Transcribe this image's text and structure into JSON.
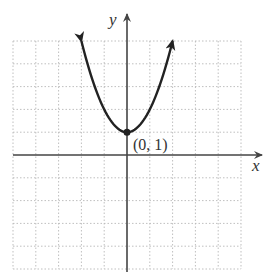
{
  "chart_data": {
    "type": "line",
    "title": "",
    "function": "y = x^2 + 1",
    "xlabel": "x",
    "ylabel": "y",
    "xlim": [
      -5,
      5
    ],
    "ylim": [
      -5,
      5
    ],
    "grid": true,
    "grid_style": "dotted",
    "tick_labels_shown": false,
    "series": [
      {
        "name": "parabola",
        "x": [
          -2,
          -1.5,
          -1,
          -0.5,
          0,
          0.5,
          1,
          1.5,
          2
        ],
        "y": [
          5,
          3.25,
          2,
          1.25,
          1,
          1.25,
          2,
          3.25,
          5
        ],
        "arrows_at_ends": true
      }
    ],
    "points": [
      {
        "x": 0,
        "y": 1,
        "label": "(0, 1)"
      }
    ],
    "annotations": [
      "(0, 1)"
    ]
  },
  "labels": {
    "x_axis": "x",
    "y_axis": "y",
    "vertex": "(0, 1)"
  },
  "colors": {
    "curve": "#222222",
    "axis": "#444444",
    "grid": "#b8b8b8"
  }
}
